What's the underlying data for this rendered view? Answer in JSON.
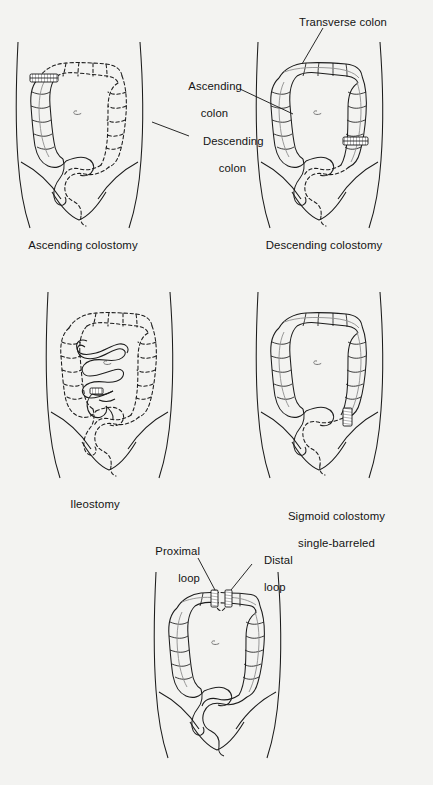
{
  "figure": {
    "background_color": "#f3f3f1",
    "ink_color": "#1c1c1c",
    "taenia_color": "#8d8d8d"
  },
  "panels": [
    {
      "id": "ascending-colostomy",
      "caption": "Ascending colostomy",
      "stoma_count": 1,
      "stoma_side": "right-abdomen-upper",
      "resected_portion": "transverse, descending, sigmoid and rectum shown dashed"
    },
    {
      "id": "descending-colostomy",
      "caption": "Descending colostomy",
      "stoma_count": 1,
      "stoma_side": "left-abdomen-lower",
      "resected_portion": "sigmoid and rectum shown dashed"
    },
    {
      "id": "ileostomy",
      "caption": "Ileostomy",
      "stoma_count": 1,
      "stoma_side": "right-abdomen-lower",
      "resected_portion": "entire colon shown dashed"
    },
    {
      "id": "sigmoid-colostomy",
      "caption": "Sigmoid colostomy\nsingle-barreled",
      "caption_line1": "Sigmoid colostomy",
      "caption_line2": "single-barreled",
      "stoma_count": 1,
      "stoma_side": "left-abdomen-lower",
      "resected_portion": "rectum shown dashed"
    },
    {
      "id": "loop-colostomy",
      "caption": "",
      "stoma_count": 2,
      "stoma_side": "transverse-colon",
      "resected_portion": "mid transverse colon shown dashed"
    }
  ],
  "annotations": {
    "transverse_colon": "Transverse colon",
    "ascending_colon_line1": "Ascending",
    "ascending_colon_line2": "colon",
    "descending_colon_line1": "Descending",
    "descending_colon_line2": "colon",
    "proximal_loop_line1": "Proximal",
    "proximal_loop_line2": "loop",
    "distal_loop_line1": "Distal",
    "distal_loop_line2": "loop"
  }
}
